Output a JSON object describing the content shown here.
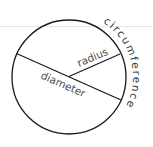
{
  "diagram": {
    "labels": {
      "radius": "radius",
      "diameter": "diameter",
      "circumference": "circumference"
    },
    "colors": {
      "background": "#ffffff",
      "stroke": "#1a1a1a",
      "text": "#4a4a4a",
      "guide_line": "#e6e6e6"
    },
    "geometry": {
      "center": [
        69,
        77
      ],
      "radius": 57,
      "diameter_endpoints": [
        [
          17,
          54
        ],
        [
          121,
          100
        ]
      ],
      "radius_endpoint": [
        120,
        54
      ]
    }
  }
}
